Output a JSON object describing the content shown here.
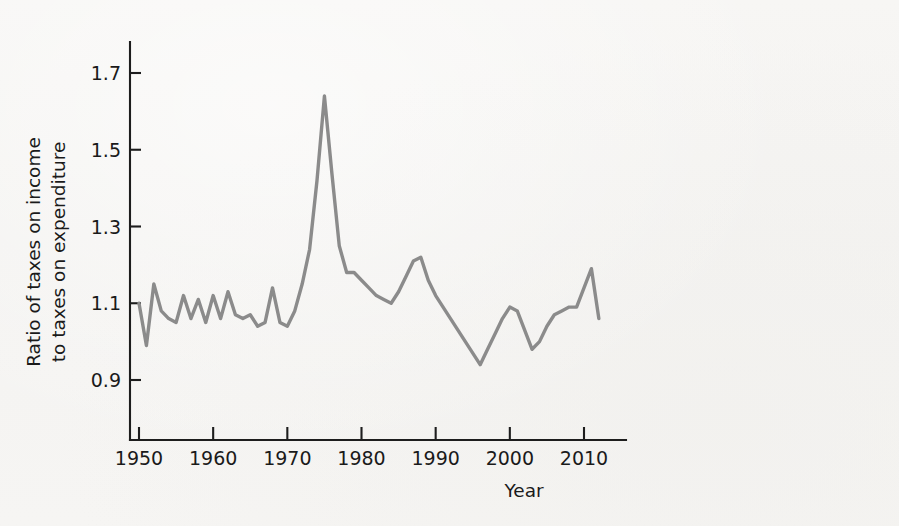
{
  "chart_data": {
    "type": "line",
    "title": "",
    "subtitle": "",
    "xlabel": "Year",
    "ylabel": "Ratio of taxes on income to taxes on expenditure",
    "ylabel_line1": "Ratio of taxes on income",
    "ylabel_line2": "to taxes on expenditure",
    "xlim": [
      1949,
      2013
    ],
    "ylim": [
      0.82,
      1.78
    ],
    "grid": false,
    "legend": null,
    "xticks": [
      1950,
      1960,
      1970,
      1980,
      1990,
      2000,
      2010
    ],
    "xtick_labels": [
      "1950",
      "1960",
      "1970",
      "1980",
      "1990",
      "2000",
      "2010"
    ],
    "yticks": [
      0.9,
      1.1,
      1.3,
      1.5,
      1.7
    ],
    "ytick_labels": [
      "0.9",
      "1.1",
      "1.3",
      "1.5",
      "1.7"
    ],
    "line_color": "#8b8b8b",
    "axis_color": "#1d1d1d",
    "background_color": "#f6f5f3",
    "x": [
      1950,
      1951,
      1952,
      1953,
      1954,
      1955,
      1956,
      1957,
      1958,
      1959,
      1960,
      1961,
      1962,
      1963,
      1964,
      1965,
      1966,
      1967,
      1968,
      1969,
      1970,
      1971,
      1972,
      1973,
      1974,
      1975,
      1976,
      1977,
      1978,
      1979,
      1980,
      1981,
      1982,
      1983,
      1984,
      1985,
      1986,
      1987,
      1988,
      1989,
      1990,
      1991,
      1992,
      1993,
      1994,
      1995,
      1996,
      1997,
      1998,
      1999,
      2000,
      2001,
      2002,
      2003,
      2004,
      2005,
      2006,
      2007,
      2008,
      2009,
      2010,
      2011,
      2012
    ],
    "y": [
      1.1,
      0.99,
      1.15,
      1.08,
      1.06,
      1.05,
      1.12,
      1.06,
      1.11,
      1.05,
      1.12,
      1.06,
      1.13,
      1.07,
      1.06,
      1.07,
      1.04,
      1.05,
      1.14,
      1.05,
      1.04,
      1.08,
      1.15,
      1.24,
      1.42,
      1.64,
      1.44,
      1.25,
      1.18,
      1.18,
      1.16,
      1.14,
      1.12,
      1.11,
      1.1,
      1.13,
      1.17,
      1.21,
      1.22,
      1.16,
      1.12,
      1.09,
      1.06,
      1.03,
      1.0,
      0.97,
      0.94,
      0.98,
      1.02,
      1.06,
      1.09,
      1.08,
      1.03,
      0.98,
      1.0,
      1.04,
      1.07,
      1.08,
      1.09,
      1.09,
      1.14,
      1.19,
      1.06
    ]
  },
  "axes": {
    "y_axis_name": "y-axis",
    "x_axis_name": "x-axis"
  }
}
